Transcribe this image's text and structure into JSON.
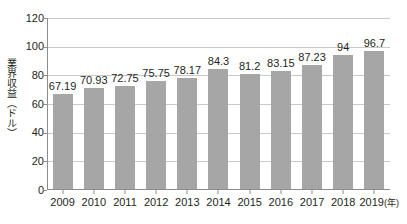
{
  "chart_data": {
    "type": "bar",
    "title": "",
    "subtitle": "",
    "xlabel": "(年)",
    "ylabel": "業界収益（ドル）",
    "categories": [
      "2009",
      "2010",
      "2011",
      "2012",
      "2013",
      "2014",
      "2015",
      "2016",
      "2017",
      "2018",
      "2019"
    ],
    "values": [
      67.19,
      70.93,
      72.75,
      75.75,
      78.17,
      84.3,
      81.2,
      83.15,
      87.23,
      94,
      96.7
    ],
    "value_labels": [
      "67.19",
      "70.93",
      "72.75",
      "75.75",
      "78.17",
      "84.3",
      "81.2",
      "83.15",
      "87.23",
      "94",
      "96.7"
    ],
    "ylim": [
      0,
      120
    ],
    "ytick_values": [
      0,
      20,
      40,
      60,
      80,
      100,
      120
    ],
    "ytick_labels": [
      "0",
      "20",
      "40",
      "60",
      "80",
      "100",
      "120"
    ],
    "grid": true,
    "legend": false,
    "legend_position": "none",
    "bar_color": "#a6a6a6",
    "axis_color": "#8d8d8d",
    "grid_color": "#c9c9c9",
    "text_color": "#231f20",
    "background": "#ffffff"
  },
  "axis": {
    "x_unit_label": "(年)",
    "y_title": "業界収益（ドル）"
  }
}
